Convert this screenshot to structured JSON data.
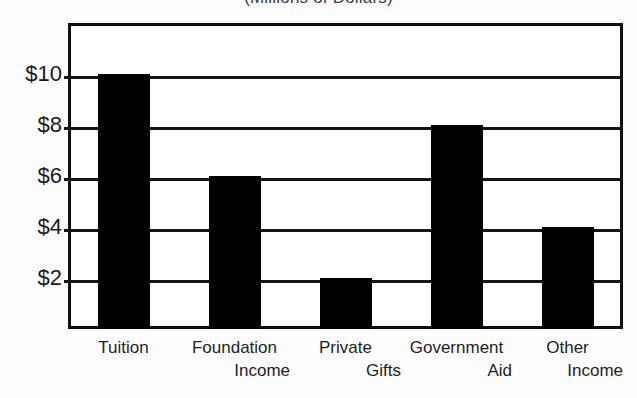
{
  "chart_data": {
    "type": "bar",
    "title": "(Millions of Dollars)",
    "xlabel": "",
    "ylabel": "",
    "categories": [
      "Tuition",
      "Foundation Income",
      "Private Gifts",
      "Government Aid",
      "Other Income"
    ],
    "category_lines": [
      [
        "Tuition",
        ""
      ],
      [
        "Foundation",
        "Income"
      ],
      [
        "Private",
        "Gifts"
      ],
      [
        "Government",
        "Aid"
      ],
      [
        "Other",
        "Income"
      ]
    ],
    "values": [
      10,
      6,
      2,
      8,
      4
    ],
    "ylim": [
      0,
      12
    ],
    "ytick_values": [
      2,
      4,
      6,
      8,
      10
    ],
    "ytick_labels": [
      "$2",
      "$4",
      "$6",
      "$8",
      "$10"
    ],
    "grid": true,
    "legend": false,
    "bar_color": "#000000",
    "frame_color": "#101010",
    "background_color": "#ffffff"
  }
}
